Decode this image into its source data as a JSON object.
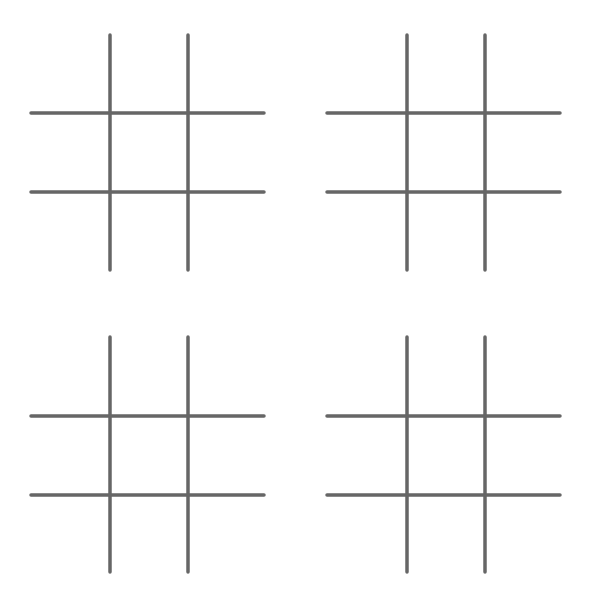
{
  "game": {
    "type": "tic-tac-toe",
    "line_color": "#666666",
    "background": "#ffffff",
    "boards": [
      {
        "id": "board-1",
        "position": "top-left",
        "x": 31,
        "y": 35,
        "width": 233,
        "height": 235,
        "v_lines": [
          79,
          157
        ],
        "h_lines": [
          78,
          157
        ],
        "cells": [
          "",
          "",
          "",
          "",
          "",
          "",
          "",
          "",
          ""
        ]
      },
      {
        "id": "board-2",
        "position": "top-right",
        "x": 327,
        "y": 35,
        "width": 233,
        "height": 235,
        "v_lines": [
          80,
          158
        ],
        "h_lines": [
          78,
          157
        ],
        "cells": [
          "",
          "",
          "",
          "",
          "",
          "",
          "",
          "",
          ""
        ]
      },
      {
        "id": "board-3",
        "position": "bottom-left",
        "x": 31,
        "y": 337,
        "width": 233,
        "height": 235,
        "v_lines": [
          79,
          157
        ],
        "h_lines": [
          79,
          158
        ],
        "cells": [
          "",
          "",
          "",
          "",
          "",
          "",
          "",
          "",
          ""
        ]
      },
      {
        "id": "board-4",
        "position": "bottom-right",
        "x": 327,
        "y": 337,
        "width": 233,
        "height": 235,
        "v_lines": [
          80,
          158
        ],
        "h_lines": [
          79,
          158
        ],
        "cells": [
          "",
          "",
          "",
          "",
          "",
          "",
          "",
          "",
          ""
        ]
      }
    ]
  }
}
